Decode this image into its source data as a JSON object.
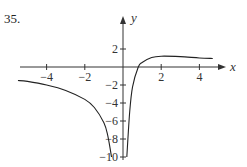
{
  "problem": {
    "number": "35."
  },
  "chart_data": {
    "type": "line",
    "title": "",
    "xlabel": "x",
    "ylabel": "y",
    "xlim": [
      -5.5,
      5.6
    ],
    "ylim": [
      -10.5,
      4.5
    ],
    "grid": false,
    "x_ticks": [
      -4,
      -2,
      2,
      4
    ],
    "x_tick_labels": [
      "−4",
      "−2",
      "2",
      "4"
    ],
    "y_ticks": [
      2,
      -2,
      -4,
      -6,
      -8,
      -10
    ],
    "y_tick_labels": [
      "2",
      "−2",
      "−4",
      "−6",
      "−8",
      "−10"
    ],
    "vertical_asymptote": 0,
    "series": [
      {
        "name": "left branch",
        "x": [
          -5.5,
          -5,
          -4,
          -3,
          -2,
          -1.5,
          -1,
          -0.8,
          -0.6
        ],
        "y": [
          -1.5,
          -1.6,
          -2.0,
          -2.6,
          -3.6,
          -4.5,
          -6.2,
          -7.6,
          -10
        ]
      },
      {
        "name": "right branch",
        "x": [
          0.2,
          0.35,
          0.5,
          0.8,
          1.0,
          1.5,
          2.0,
          3.0,
          4.0,
          4.7
        ],
        "y": [
          -10,
          -5,
          -2.2,
          0,
          0.5,
          1.05,
          1.2,
          1.15,
          1.0,
          0.95
        ]
      }
    ]
  }
}
